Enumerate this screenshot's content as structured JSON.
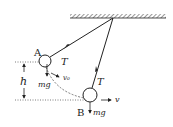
{
  "diagram": {
    "type": "pendulum-forces",
    "labels": {
      "point_a": "A",
      "point_b": "B",
      "tension_a": "T",
      "tension_b": "T",
      "weight_a": "mg",
      "weight_b": "mg",
      "velocity_a": "v₀",
      "velocity_b": "v",
      "height": "h"
    },
    "colors": {
      "stroke": "#222222",
      "background": "#ffffff"
    }
  }
}
